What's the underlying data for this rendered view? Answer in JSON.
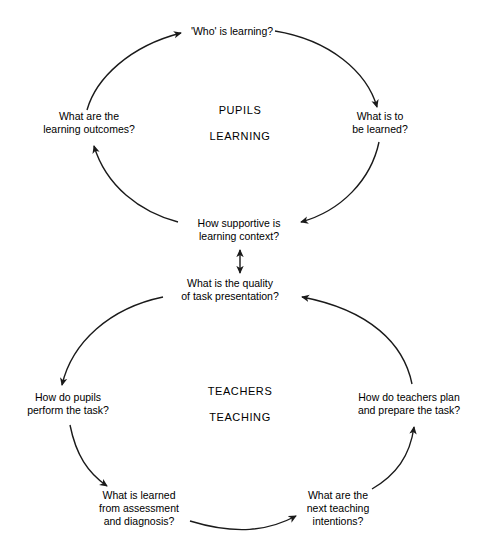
{
  "diagram": {
    "background_color": "#ffffff",
    "stroke_color": "#1a1a1a",
    "cycles": [
      {
        "id": "pupils-learning",
        "center_label_line1": "PUPILS",
        "center_label_line2": "LEARNING",
        "direction": "counter-clockwise",
        "nodes": [
          {
            "id": "who-is-learning",
            "text_lines": [
              "'Who' is learning?"
            ],
            "x": 232,
            "y": 31
          },
          {
            "id": "what-is-to-be-learned",
            "text_lines": [
              "What is to",
              "be learned?"
            ],
            "x": 380,
            "y": 123
          },
          {
            "id": "how-supportive-is-learning-context",
            "text_lines": [
              "How supportive is",
              "learning context?"
            ],
            "x": 239,
            "y": 230
          },
          {
            "id": "what-are-the-learning-outcomes",
            "text_lines": [
              "What are the",
              "learning outcomes?"
            ],
            "x": 89,
            "y": 123
          }
        ]
      },
      {
        "id": "teachers-teaching",
        "center_label_line1": "TEACHERS",
        "center_label_line2": "TEACHING",
        "direction": "clockwise",
        "nodes": [
          {
            "id": "what-is-the-quality-of-task-presentation",
            "text_lines": [
              "What is the quality",
              "of task presentation?"
            ],
            "x": 230,
            "y": 290
          },
          {
            "id": "how-do-teachers-plan-and-prepare-the-task",
            "text_lines": [
              "How do teachers plan",
              "and prepare the task?"
            ],
            "x": 409,
            "y": 404
          },
          {
            "id": "what-are-the-next-teaching-intentions",
            "text_lines": [
              "What are the",
              "next teaching",
              "intentions?"
            ],
            "x": 338,
            "y": 508
          },
          {
            "id": "what-is-learned-from-assessment-and-diagnosis",
            "text_lines": [
              "What is learned",
              "from assessment",
              "and diagnosis?"
            ],
            "x": 139,
            "y": 508
          },
          {
            "id": "how-do-pupils-perform-the-task",
            "text_lines": [
              "How do pupils",
              "perform the task?"
            ],
            "x": 68,
            "y": 404
          }
        ]
      }
    ],
    "connector": {
      "id": "cycle-connector",
      "type": "double-headed-vertical-arrow",
      "from": "how-supportive-is-learning-context",
      "to": "what-is-the-quality-of-task-presentation"
    }
  }
}
